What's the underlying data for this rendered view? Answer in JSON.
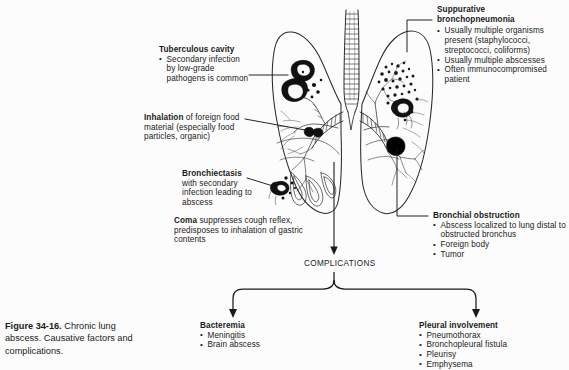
{
  "figure": {
    "caption_label": "Figure 34-16.",
    "caption_text": "Chronic lung abscess. Causative factors and complications."
  },
  "diagram": {
    "center_node": "COMPLICATIONS",
    "illustration_name": "lungs-trachea-bronchial-tree-illustration"
  },
  "labels": {
    "tuberculous_cavity": {
      "heading": "Tuberculous cavity",
      "bullets": [
        "Secondary infection by low-grade pathogens is common"
      ]
    },
    "inhalation": {
      "heading_inline": "Inhalation",
      "rest_inline": " of foreign food material (especially food particles, organic)"
    },
    "bronchiectasis": {
      "heading": "Bronchiectasis",
      "body": "with secondary infection leading to abscess"
    },
    "coma": {
      "heading_inline": "Coma",
      "rest_inline": " suppresses cough reflex, predisposes to inhalation of gastric contents"
    },
    "suppurative_bronchopneumonia": {
      "heading_line1": "Suppurative",
      "heading_line2": "bronchopneumonia",
      "bullets": [
        "Usually multiple organisms present (staphylococci, streptococci, coliforms)",
        "Usually multiple abscesses",
        "Often immunocompromised patient"
      ]
    },
    "bronchial_obstruction": {
      "heading": "Bronchial obstruction",
      "bullets": [
        "Abscess localized to lung distal to obstructed bronchus",
        "Foreign body",
        "Tumor"
      ]
    }
  },
  "complications": {
    "bacteremia": {
      "heading": "Bacteremia",
      "bullets": [
        "Meningitis",
        "Brain abscess"
      ]
    },
    "pleural_involvement": {
      "heading": "Pleural involvement",
      "bullets": [
        "Pneumothorax",
        "Bronchopleural fistula",
        "Pleurisy",
        "Emphysema"
      ]
    }
  },
  "colors": {
    "ink": "#1a1a1a",
    "paper": "#fcfcfc",
    "lesion": "#000000"
  }
}
